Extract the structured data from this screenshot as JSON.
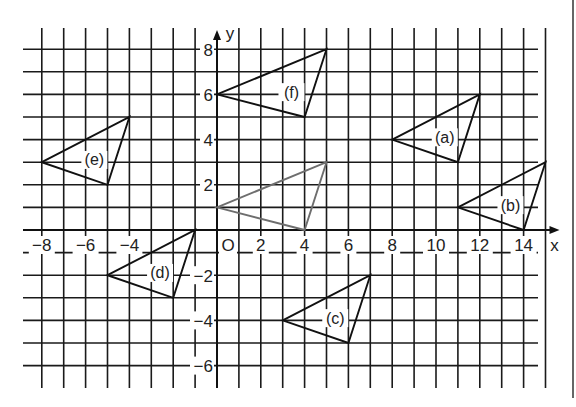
{
  "figure": {
    "x_axis_label": "x",
    "y_axis_label": "y",
    "origin_label": "O",
    "x_tick_labels": [
      {
        "value": -8,
        "text": "−8"
      },
      {
        "value": -6,
        "text": "−6"
      },
      {
        "value": -4,
        "text": "−4"
      },
      {
        "value": 2,
        "text": "2"
      },
      {
        "value": 4,
        "text": "4"
      },
      {
        "value": 6,
        "text": "6"
      },
      {
        "value": 8,
        "text": "8"
      },
      {
        "value": 10,
        "text": "10"
      },
      {
        "value": 12,
        "text": "12"
      },
      {
        "value": 14,
        "text": "14"
      }
    ],
    "y_tick_labels": [
      {
        "value": 8,
        "text": "8"
      },
      {
        "value": 6,
        "text": "6"
      },
      {
        "value": 4,
        "text": "4"
      },
      {
        "value": 2,
        "text": "2"
      },
      {
        "value": -2,
        "text": "−2"
      },
      {
        "value": -4,
        "text": "−4"
      },
      {
        "value": -6,
        "text": "−6"
      }
    ],
    "grid": {
      "x_min": -8,
      "x_max": 15,
      "y_min": -6,
      "y_max": 8
    },
    "colors": {
      "grid": "#1a1a1a",
      "triangle": "#111111",
      "object_triangle": "#6e6e6e"
    },
    "object_triangle": {
      "name": "original",
      "label": "",
      "vertices": [
        [
          0,
          1
        ],
        [
          5,
          3
        ],
        [
          4,
          0
        ]
      ]
    },
    "triangles": [
      {
        "label": "(a)",
        "vertices": [
          [
            8,
            4
          ],
          [
            12,
            6
          ],
          [
            11,
            3
          ]
        ],
        "label_pos": [
          10.4,
          4.1
        ]
      },
      {
        "label": "(b)",
        "vertices": [
          [
            11,
            1
          ],
          [
            15,
            3
          ],
          [
            14,
            0
          ]
        ],
        "label_pos": [
          13.4,
          1.1
        ]
      },
      {
        "label": "(c)",
        "vertices": [
          [
            3,
            -4
          ],
          [
            7,
            -2
          ],
          [
            6,
            -5
          ]
        ],
        "label_pos": [
          5.4,
          -3.9
        ]
      },
      {
        "label": "(d)",
        "vertices": [
          [
            -5,
            -2
          ],
          [
            -1,
            0
          ],
          [
            -2,
            -3
          ]
        ],
        "label_pos": [
          -2.6,
          -1.9
        ]
      },
      {
        "label": "(e)",
        "vertices": [
          [
            -8,
            3
          ],
          [
            -4,
            5
          ],
          [
            -5,
            2
          ]
        ],
        "label_pos": [
          -5.6,
          3.1
        ]
      },
      {
        "label": "(f)",
        "vertices": [
          [
            0,
            6
          ],
          [
            5,
            8
          ],
          [
            4,
            5
          ]
        ],
        "label_pos": [
          3.4,
          6.1
        ]
      }
    ]
  },
  "chart_data": {
    "type": "scatter",
    "title": "",
    "xlabel": "x",
    "ylabel": "y",
    "xlim": [
      -8,
      15
    ],
    "ylim": [
      -6,
      8
    ],
    "grid": true,
    "series": [
      {
        "name": "original (gray)",
        "values": [
          [
            0,
            1
          ],
          [
            5,
            3
          ],
          [
            4,
            0
          ]
        ]
      },
      {
        "name": "(a)",
        "values": [
          [
            8,
            4
          ],
          [
            12,
            6
          ],
          [
            11,
            3
          ]
        ]
      },
      {
        "name": "(b)",
        "values": [
          [
            11,
            1
          ],
          [
            15,
            3
          ],
          [
            14,
            0
          ]
        ]
      },
      {
        "name": "(c)",
        "values": [
          [
            3,
            -4
          ],
          [
            7,
            -2
          ],
          [
            6,
            -5
          ]
        ]
      },
      {
        "name": "(d)",
        "values": [
          [
            -5,
            -2
          ],
          [
            -1,
            0
          ],
          [
            -2,
            -3
          ]
        ]
      },
      {
        "name": "(e)",
        "values": [
          [
            -8,
            3
          ],
          [
            -4,
            5
          ],
          [
            -5,
            2
          ]
        ]
      },
      {
        "name": "(f)",
        "values": [
          [
            0,
            6
          ],
          [
            5,
            8
          ],
          [
            4,
            5
          ]
        ]
      }
    ]
  }
}
